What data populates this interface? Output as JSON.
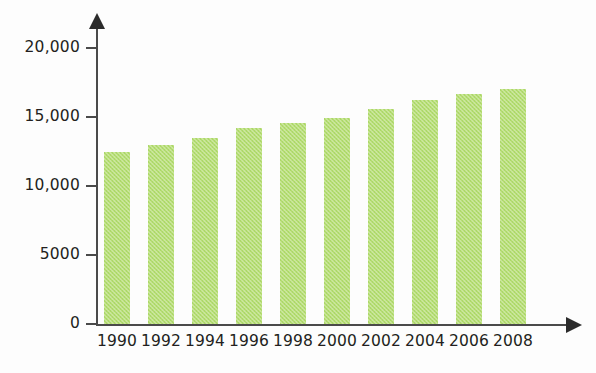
{
  "chart_data": {
    "type": "bar",
    "title": "",
    "xlabel": "",
    "ylabel": "",
    "categories": [
      "1990",
      "1992",
      "1994",
      "1996",
      "1998",
      "2000",
      "2002",
      "2004",
      "2006",
      "2008"
    ],
    "values": [
      12500,
      13000,
      13500,
      14200,
      14600,
      14900,
      15600,
      16200,
      16700,
      17000
    ],
    "ylim": [
      0,
      20000
    ],
    "xlim_note": "categorical years, every 2 years from 1990 to 2008",
    "y_ticks": [
      0,
      5000,
      10000,
      15000,
      20000
    ],
    "y_tick_labels": [
      "0",
      "5000",
      "10,000",
      "15,000",
      "20,000"
    ],
    "x_tick_labels": [
      "1990",
      "1992",
      "1994",
      "1996",
      "1998",
      "2000",
      "2002",
      "2004",
      "2006",
      "2008"
    ],
    "grid": false,
    "legend": null,
    "legend_position": "none",
    "bar_color": "#b4dd70",
    "axis_color": "#4a4a4a",
    "text_color": "#231f20",
    "background_color": "#fdfdfd",
    "annotations": []
  },
  "axes": {
    "y_axis_name": "value-axis",
    "x_axis_name": "year-axis",
    "y_arrow": "arrow-up",
    "x_arrow": "arrow-right"
  }
}
